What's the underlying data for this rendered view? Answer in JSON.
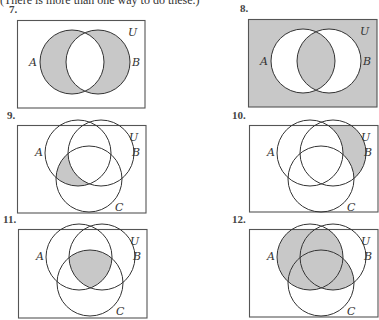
{
  "header": "(There is more than one way to do these.)",
  "shade_color": "#c8c8c8",
  "line_color": "#333333",
  "problems": [
    {
      "number": "7.",
      "sets": [
        "A",
        "B"
      ],
      "universe": "U",
      "shaded": [
        "A-only",
        "B-only"
      ],
      "description": "A symmetric difference B"
    },
    {
      "number": "8.",
      "sets": [
        "A",
        "B"
      ],
      "universe": "U",
      "shaded": [
        "outside",
        "AB"
      ],
      "description": "Complement of A symmetric difference B"
    },
    {
      "number": "9.",
      "sets": [
        "A",
        "B",
        "C"
      ],
      "universe": "U",
      "shaded": [
        "AC-only"
      ],
      "description": "A and C, not B"
    },
    {
      "number": "10.",
      "sets": [
        "A",
        "B",
        "C"
      ],
      "universe": "U",
      "shaded": [
        "B-only"
      ],
      "description": "B only"
    },
    {
      "number": "11.",
      "sets": [
        "A",
        "B",
        "C"
      ],
      "universe": "U",
      "shaded": [
        "ABC"
      ],
      "description": "A intersect B intersect C"
    },
    {
      "number": "12.",
      "sets": [
        "A",
        "B",
        "C"
      ],
      "universe": "U",
      "shaded": [
        "A-only",
        "AB-only",
        "AC-only",
        "ABC",
        "BC-only"
      ],
      "description": "A union (B intersect C)"
    }
  ]
}
